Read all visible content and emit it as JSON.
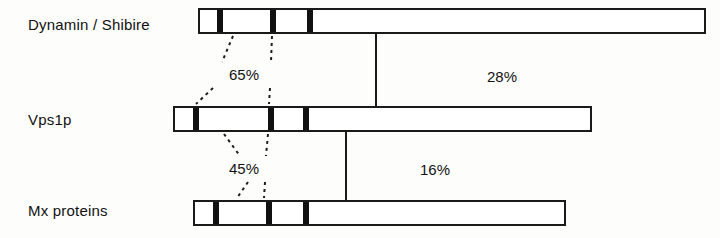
{
  "figure": {
    "kind": "protein-domain-comparison",
    "rows": [
      {
        "label": "Dynamin / Shibire",
        "label_x": 28,
        "label_y": 16,
        "bar": {
          "x": 198,
          "y": 8,
          "width": 508,
          "height": 26
        },
        "bands": [
          {
            "x": 217,
            "width": 6
          },
          {
            "x": 270,
            "width": 6
          },
          {
            "x": 307,
            "width": 6
          }
        ]
      },
      {
        "label": "Vps1p",
        "label_x": 28,
        "label_y": 111,
        "bar": {
          "x": 173,
          "y": 106,
          "width": 419,
          "height": 26
        },
        "bands": [
          {
            "x": 191,
            "width": 6
          },
          {
            "x": 266,
            "width": 6
          },
          {
            "x": 301,
            "width": 6
          }
        ]
      },
      {
        "label": "Mx proteins",
        "label_x": 28,
        "label_y": 202,
        "bar": {
          "x": 193,
          "y": 200,
          "width": 373,
          "height": 26
        },
        "bands": [
          {
            "x": 211,
            "width": 6
          },
          {
            "x": 264,
            "width": 6
          },
          {
            "x": 301,
            "width": 6
          }
        ]
      }
    ],
    "percent_labels": [
      {
        "text": "65%",
        "x": 229,
        "y": 66
      },
      {
        "text": "28%",
        "x": 487,
        "y": 68
      },
      {
        "text": "45%",
        "x": 229,
        "y": 160
      },
      {
        "text": "16%",
        "x": 420,
        "y": 161
      }
    ],
    "solid_connectors": [
      {
        "x": 375,
        "y": 34,
        "height": 74
      },
      {
        "x": 345,
        "y": 132,
        "height": 70
      }
    ],
    "dashed_connectors": [
      {
        "x1": 233,
        "y1": 36,
        "x2": 222,
        "y2": 62
      },
      {
        "x1": 272,
        "y1": 36,
        "x2": 271,
        "y2": 62
      },
      {
        "x1": 213,
        "y1": 88,
        "x2": 196,
        "y2": 104
      },
      {
        "x1": 270,
        "y1": 88,
        "x2": 269,
        "y2": 104
      },
      {
        "x1": 224,
        "y1": 134,
        "x2": 240,
        "y2": 156
      },
      {
        "x1": 268,
        "y1": 134,
        "x2": 266,
        "y2": 156
      },
      {
        "x1": 248,
        "y1": 182,
        "x2": 237,
        "y2": 198
      },
      {
        "x1": 265,
        "y1": 182,
        "x2": 264,
        "y2": 198
      }
    ],
    "colors": {
      "band": "#111111",
      "outline": "#1a1a1a",
      "background": "#fdfdfc",
      "text": "#111111"
    }
  }
}
